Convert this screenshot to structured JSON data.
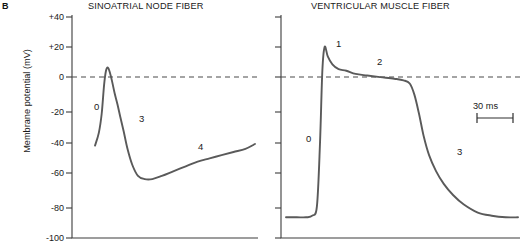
{
  "figure": {
    "panel_letter": "B",
    "y_axis_title": "Membrane potential (mV)",
    "scalebar_label": "30 ms",
    "line_color": "#5a5a5a",
    "axis_color": "#3c3c3c",
    "text_color": "#1a1a1a"
  },
  "chart_data": [
    {
      "type": "line",
      "title": "SINOATRIAL NODE FIBER",
      "xlabel": "",
      "ylabel": "Membrane potential (mV)",
      "ylim": [
        -100,
        40
      ],
      "yticks": [
        40,
        20,
        0,
        -20,
        -40,
        -60,
        -80,
        -100
      ],
      "ytick_labels": [
        "+40",
        "+20",
        "0",
        "-20",
        "-40",
        "-60",
        "-80",
        "-100"
      ],
      "grid": false,
      "zero_reference_line": 0,
      "zero_line_style": "dashed",
      "annotations": [
        {
          "text": "0",
          "x_ms": 14,
          "y_mV": -19,
          "meaning": "phase-0-upstroke"
        },
        {
          "text": "3",
          "x_ms": 46,
          "y_mV": -26,
          "meaning": "phase-3-repolarization"
        },
        {
          "text": "4",
          "x_ms": 133,
          "y_mV": -45,
          "meaning": "phase-4-pacemaker-depolarization"
        }
      ],
      "x": [
        0,
        8,
        14,
        19,
        23,
        27,
        31,
        36,
        41,
        47,
        53,
        60,
        68,
        78,
        90,
        104,
        120,
        140,
        165,
        190,
        215,
        240,
        265,
        290,
        315,
        335
      ],
      "y": [
        -42,
        -34,
        -22,
        -4,
        5,
        7,
        4,
        -2,
        -9,
        -16,
        -24,
        -33,
        -44,
        -54,
        -61,
        -63,
        -63,
        -61,
        -58,
        -55,
        -52,
        -50,
        -48,
        -46,
        -44,
        -41
      ]
    },
    {
      "type": "line",
      "title": "VENTRICULAR MUSCLE FIBER",
      "xlabel": "",
      "ylabel": "Membrane potential (mV)",
      "ylim": [
        -100,
        40
      ],
      "yticks": [
        40,
        20,
        0,
        -20,
        -40,
        -60,
        -80,
        -100
      ],
      "grid": false,
      "zero_reference_line": 0,
      "zero_line_style": "dashed",
      "scalebar_ms": 30,
      "annotations": [
        {
          "text": "0",
          "x_ms": 40,
          "y_mV": -45,
          "meaning": "phase-0-upstroke"
        },
        {
          "text": "1",
          "x_ms": 58,
          "y_mV": 18,
          "meaning": "phase-1-early-repolarization"
        },
        {
          "text": "2",
          "x_ms": 88,
          "y_mV": 7,
          "meaning": "phase-2-plateau"
        },
        {
          "text": "3",
          "x_ms": 192,
          "y_mV": -43,
          "meaning": "phase-3-repolarization"
        }
      ],
      "x": [
        0,
        14,
        26,
        34,
        40,
        44,
        47,
        50,
        54,
        60,
        68,
        78,
        90,
        105,
        122,
        140,
        152,
        160,
        166,
        172,
        178,
        185,
        194,
        204,
        216,
        230,
        248,
        266,
        284,
        300
      ],
      "y": [
        -87,
        -87,
        -87,
        -86,
        -80,
        -40,
        5,
        20,
        14,
        9,
        6,
        5,
        3,
        2,
        1,
        0,
        -1,
        -3,
        -10,
        -22,
        -36,
        -48,
        -58,
        -66,
        -73,
        -79,
        -84,
        -86,
        -87,
        -87
      ]
    }
  ]
}
